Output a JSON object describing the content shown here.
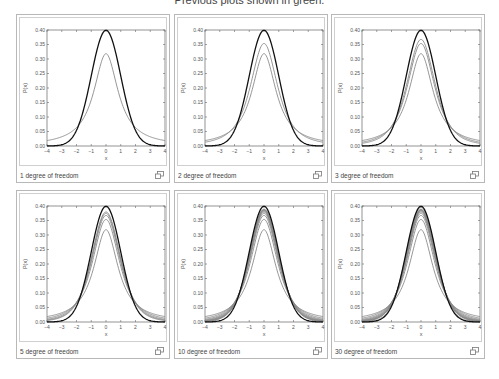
{
  "header": {
    "note": "Previous plots shown in green."
  },
  "colors": {
    "normal": "#111111",
    "previous": "#8a8a8a",
    "frame": "#b8b8b8"
  },
  "panels": [
    {
      "caption": "1 degree of freedom",
      "dofs": [
        1
      ]
    },
    {
      "caption": "2 degree of freedom",
      "dofs": [
        1,
        2
      ]
    },
    {
      "caption": "3 degree of freedom",
      "dofs": [
        1,
        2,
        3
      ]
    },
    {
      "caption": "5 degree of freedom",
      "dofs": [
        1,
        2,
        3,
        4,
        5
      ]
    },
    {
      "caption": "10 degree of freedom",
      "dofs": [
        1,
        2,
        3,
        4,
        5,
        6,
        7,
        8,
        9,
        10
      ]
    },
    {
      "caption": "30 degree of freedom",
      "dofs": [
        1,
        2,
        3,
        4,
        5,
        6,
        7,
        8,
        9,
        10,
        30
      ]
    }
  ],
  "chart_data": [
    {
      "type": "line",
      "title": "1 degree of freedom",
      "xlabel": "x",
      "ylabel": "P(x)",
      "xlim": [
        -4,
        4
      ],
      "ylim": [
        0,
        0.4
      ],
      "xticks": [
        -4,
        -3,
        -2,
        -1,
        0,
        1,
        2,
        3,
        4
      ],
      "yticks": [
        "0.00",
        "0.05",
        "0.10",
        "0.15",
        "0.20",
        "0.25",
        "0.30",
        "0.35",
        "0.40"
      ],
      "series": [
        {
          "name": "Student t (df=1)",
          "peak": 0.318
        },
        {
          "name": "Standard normal",
          "peak": 0.399
        }
      ]
    },
    {
      "type": "line",
      "title": "2 degree of freedom",
      "xlabel": "x",
      "ylabel": "P(x)",
      "xlim": [
        -4,
        4
      ],
      "ylim": [
        0,
        0.4
      ],
      "series": [
        {
          "name": "df=1",
          "peak": 0.318
        },
        {
          "name": "df=2",
          "peak": 0.354
        },
        {
          "name": "Standard normal",
          "peak": 0.399
        }
      ]
    },
    {
      "type": "line",
      "title": "3 degree of freedom",
      "xlabel": "x",
      "ylabel": "P(x)",
      "xlim": [
        -4,
        4
      ],
      "ylim": [
        0,
        0.4
      ],
      "series": [
        {
          "name": "df=1",
          "peak": 0.318
        },
        {
          "name": "df=2",
          "peak": 0.354
        },
        {
          "name": "df=3",
          "peak": 0.368
        },
        {
          "name": "Standard normal",
          "peak": 0.399
        }
      ]
    },
    {
      "type": "line",
      "title": "5 degree of freedom",
      "xlabel": "x",
      "ylabel": "P(x)",
      "xlim": [
        -4,
        4
      ],
      "ylim": [
        0,
        0.4
      ],
      "series": [
        {
          "name": "df=1..5"
        },
        {
          "name": "Standard normal",
          "peak": 0.399
        }
      ]
    },
    {
      "type": "line",
      "title": "10 degree of freedom",
      "xlabel": "x",
      "ylabel": "P(x)",
      "xlim": [
        -4,
        4
      ],
      "ylim": [
        0,
        0.4
      ],
      "series": [
        {
          "name": "df=1..10"
        },
        {
          "name": "Standard normal",
          "peak": 0.399
        }
      ]
    },
    {
      "type": "line",
      "title": "30 degree of freedom",
      "xlabel": "x",
      "ylabel": "P(x)",
      "xlim": [
        -4,
        4
      ],
      "ylim": [
        0,
        0.4
      ],
      "series": [
        {
          "name": "df=1..30"
        },
        {
          "name": "Standard normal",
          "peak": 0.399
        }
      ]
    }
  ],
  "axis": {
    "xlabel": "x",
    "ylabel": "P(x)",
    "xticks": [
      "-4",
      "-3",
      "-2",
      "-1",
      "0",
      "1",
      "2",
      "3",
      "4"
    ],
    "yticks": [
      "0.00",
      "0.05",
      "0.10",
      "0.15",
      "0.20",
      "0.25",
      "0.30",
      "0.35",
      "0.40"
    ]
  }
}
